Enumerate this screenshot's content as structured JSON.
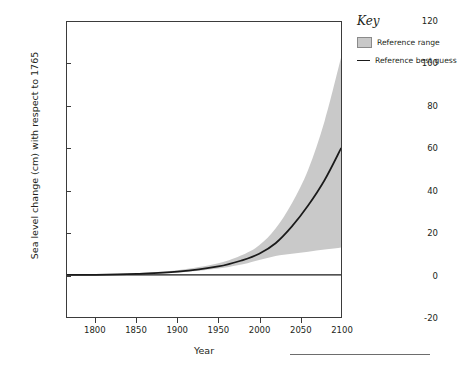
{
  "figure": {
    "top_clipped_caption": "",
    "legend": {
      "title": "Key",
      "items": [
        {
          "label": "Reference range",
          "symbol": "filled-square",
          "color": "#c8c8c8"
        },
        {
          "label": "Reference best guess",
          "symbol": "line",
          "color": "#1a1a1a"
        }
      ]
    }
  },
  "chart_data": {
    "type": "area",
    "title": "",
    "xlabel": "Year",
    "ylabel": "Sea level change (cm) with respect to 1765",
    "xlim": [
      1765,
      2100
    ],
    "ylim": [
      -20,
      120
    ],
    "xticks": [
      1800,
      1850,
      1900,
      1950,
      2000,
      2050,
      2100
    ],
    "xticklabels": [
      "1800",
      "1850",
      "1900",
      "1950",
      "2000",
      "2050",
      "2100"
    ],
    "yticks": [
      -20,
      0,
      20,
      40,
      60,
      80,
      100,
      120
    ],
    "yticklabels": [
      "-20",
      "0",
      "20",
      "40",
      "60",
      "80",
      "100",
      "120"
    ],
    "grid": false,
    "legend_position": "outside-right-top",
    "zero_line": 0,
    "x": [
      1765,
      1800,
      1850,
      1900,
      1950,
      1980,
      2000,
      2020,
      2040,
      2060,
      2080,
      2100
    ],
    "series": [
      {
        "name": "Reference best guess",
        "type": "line",
        "color": "#1a1a1a",
        "values": [
          0,
          0,
          0.5,
          1.5,
          4,
          7,
          10,
          15,
          23,
          33,
          45,
          60
        ]
      },
      {
        "name": "Reference range",
        "type": "band",
        "color": "#c8c8c8",
        "lower": [
          0,
          0,
          0.3,
          1.0,
          3,
          5,
          7,
          9,
          10,
          11,
          12,
          13
        ],
        "upper": [
          0,
          0,
          0.8,
          2.2,
          5.5,
          9.5,
          14,
          22,
          34,
          50,
          73,
          103
        ]
      }
    ]
  }
}
